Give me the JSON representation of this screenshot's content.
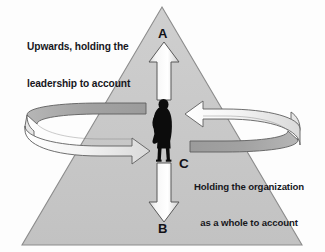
{
  "diagram": {
    "shape": {
      "name": "triangle",
      "apex": [
        162,
        7
      ],
      "bottom_left": [
        22,
        245
      ],
      "bottom_right": [
        302,
        245
      ],
      "fill_color": "#c6c6c6",
      "stroke_color": "#8f8f8f"
    },
    "labels": {
      "upwards_line1": "Upwards, holding the",
      "upwards_line2": "leadership to account",
      "holding_org_line1": "Holding the organization",
      "holding_org_line2": "as a whole to account"
    },
    "markers": {
      "a": "A",
      "b": "B",
      "c": "C"
    },
    "arrows": {
      "up_arrow_label": "up-arrow",
      "down_arrow_label": "down-arrow",
      "left_band_label": "left-circular-band-arrow",
      "right_band_label": "right-circular-band-arrow"
    },
    "figure": {
      "name": "person-silhouette",
      "color": "#0c0c0c"
    },
    "colors": {
      "triangle_fill": "#c6c6c6",
      "triangle_stroke": "#8f8f8f",
      "arrow_fill_light": "#f2f2f2",
      "arrow_fill_mid": "#d8d8d8",
      "band_top_dark": "#a0a0a0",
      "band_front_light": "#efefef",
      "outline": "#5a5a5a",
      "text": "#17171c",
      "background": "#fdfdfd"
    }
  }
}
